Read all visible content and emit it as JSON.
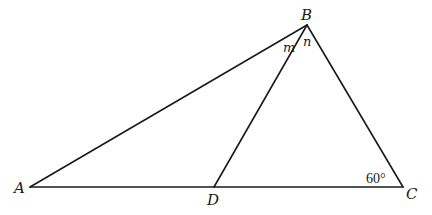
{
  "diagram": {
    "type": "triangle",
    "colors": {
      "stroke": "#1a1a1a",
      "background": "#ffffff"
    },
    "points": {
      "A": {
        "label": "A",
        "x": 30,
        "y": 187
      },
      "B": {
        "label": "B",
        "x": 307,
        "y": 25
      },
      "C": {
        "label": "C",
        "x": 403,
        "y": 187
      },
      "D": {
        "label": "D",
        "x": 214,
        "y": 187
      }
    },
    "segments": [
      {
        "from": "A",
        "to": "B"
      },
      {
        "from": "B",
        "to": "C"
      },
      {
        "from": "A",
        "to": "C"
      },
      {
        "from": "B",
        "to": "D"
      }
    ],
    "angle_labels": {
      "m": "m",
      "n": "n",
      "C": "60°"
    }
  }
}
